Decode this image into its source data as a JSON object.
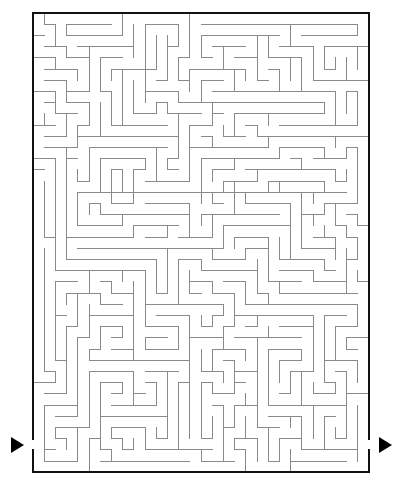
{
  "page": {
    "background_color": "#ffffff"
  },
  "maze": {
    "name": "rectangular-perfect-maze",
    "cols": 30,
    "rows": 41,
    "cell_size": 11.2,
    "origin_x": 33,
    "origin_y": 13,
    "width": 336,
    "height": 464,
    "wall_color": "#8a8a8a",
    "wall_width": 1,
    "border_color": "#111111",
    "border_width": 2,
    "entrance": {
      "label": "entrance",
      "side": "left",
      "row": 38
    },
    "exit": {
      "label": "exit",
      "side": "right",
      "row": 38
    },
    "markers": [
      {
        "name": "entrance-arrow",
        "glyph": "right-triangle",
        "color": "#000000",
        "x": 11,
        "y": 437,
        "size": 17
      },
      {
        "name": "exit-arrow",
        "glyph": "right-triangle",
        "color": "#000000",
        "x": 379,
        "y": 437,
        "size": 17
      }
    ],
    "seed": 20240517
  }
}
